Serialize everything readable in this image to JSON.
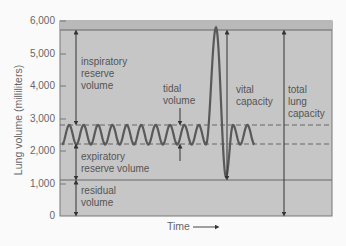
{
  "chart_data": {
    "type": "line",
    "title": "",
    "xlabel": "Time",
    "ylabel": "Lung volume (milliliters)",
    "ylim": [
      0,
      6000
    ],
    "yticks": [
      0,
      1000,
      2000,
      3000,
      4000,
      5000,
      6000
    ],
    "ytick_labels": [
      "0",
      "1,000",
      "2,000",
      "3,000",
      "4,000",
      "5,000",
      "6,000"
    ],
    "grid": false,
    "legend": null,
    "reference_lines": [
      {
        "name": "total lung capacity level",
        "value": 5800,
        "style": "solid"
      },
      {
        "name": "tidal inspiration level",
        "value": 2800,
        "style": "dashed"
      },
      {
        "name": "tidal expiration level",
        "value": 2200,
        "style": "dashed"
      },
      {
        "name": "residual volume level",
        "value": 1200,
        "style": "solid"
      }
    ],
    "series": [
      {
        "name": "spirogram",
        "description": "Quiet tidal breathing oscillating between ~2,200 and ~2,800 mL (10 cycles), then a maximal inspiration to ~5,800 mL followed by maximal expiration to ~1,200 mL, then 2 more tidal cycles.",
        "tidal_min": 2200,
        "tidal_max": 2800,
        "max_inspiration": 5800,
        "max_expiration": 1200,
        "tidal_cycles_before": 10,
        "tidal_cycles_after": 2
      }
    ],
    "annotations": [
      {
        "label": "inspiratory reserve volume",
        "from": 2800,
        "to": 5800
      },
      {
        "label": "tidal volume",
        "from": 2200,
        "to": 2800
      },
      {
        "label": "expiratory reserve volume",
        "from": 1200,
        "to": 2200
      },
      {
        "label": "residual volume",
        "from": 0,
        "to": 1200
      },
      {
        "label": "vital capacity",
        "from": 1200,
        "to": 5800
      },
      {
        "label": "total lung capacity",
        "from": 0,
        "to": 5800
      }
    ]
  },
  "labels": {
    "ylabel": "Lung volume (milliliters)",
    "xlabel": "Time",
    "irv": [
      "inspiratory",
      "reserve",
      "volume"
    ],
    "tidal": [
      "tidal",
      "volume"
    ],
    "vital": [
      "vital",
      "capacity"
    ],
    "tlc": [
      "total",
      "lung",
      "capacity"
    ],
    "erv": [
      "expiratory",
      "reserve volume"
    ],
    "rv": [
      "residual",
      "volume"
    ]
  },
  "colors": {
    "plot_bg": "#c9c9c9",
    "band_bg": "#bdbdbd",
    "line": "#555555",
    "trace": "#5a5a5a"
  }
}
